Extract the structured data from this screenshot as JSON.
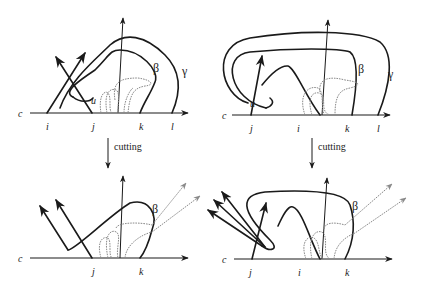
{
  "panels": {
    "top_left": {
      "axis_label": "c",
      "points": [
        "i",
        "j",
        "k",
        "l"
      ],
      "intersection_label": "u",
      "curve_labels": [
        "β",
        "γ"
      ]
    },
    "top_right": {
      "axis_label": "c",
      "points": [
        "j",
        "i",
        "k",
        "l"
      ],
      "intersection_label": "u",
      "curve_labels": [
        "β",
        "γ"
      ]
    },
    "bottom_left": {
      "axis_label": "c",
      "points": [
        "j",
        "k"
      ],
      "curve_labels": [
        "β"
      ]
    },
    "bottom_right": {
      "axis_label": "c",
      "points": [
        "j",
        "i",
        "k"
      ],
      "curve_labels": [
        "β"
      ]
    }
  },
  "arrows": {
    "left": {
      "label": "cutting"
    },
    "right": {
      "label": "cutting"
    }
  },
  "colors": {
    "ink": "#1a1a1a",
    "grey_curve": "#8a8a8a"
  }
}
